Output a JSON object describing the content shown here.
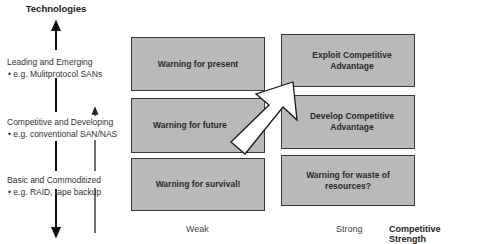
{
  "y_axis": {
    "title": "Technologies",
    "tiers": [
      {
        "label": "Leading and Emerging",
        "example": "• e.g. Mulitprotocol SANs"
      },
      {
        "label": "Competitive and Developing",
        "example": "• e.g. conventional SAN/NAS"
      },
      {
        "label": "Basic and Commoditized",
        "example": "• e.g. RAID, tape backup"
      }
    ]
  },
  "matrix": {
    "weak": [
      {
        "text": "Warning for present"
      },
      {
        "text": "Warning for future"
      },
      {
        "text": "Warning for survival!"
      }
    ],
    "strong": [
      {
        "text": "Exploit Competitive Advantage"
      },
      {
        "text": "Develop Competitive Advantage"
      },
      {
        "text": "Warning for waste of resources?"
      }
    ]
  },
  "x_axis": {
    "labels": [
      "Weak",
      "Strong"
    ],
    "title": "Competitive Strength"
  },
  "colors": {
    "box_fill": "#b9b9b9",
    "box_border": "#3a3a3a",
    "arrow_fill": "#ffffff"
  }
}
